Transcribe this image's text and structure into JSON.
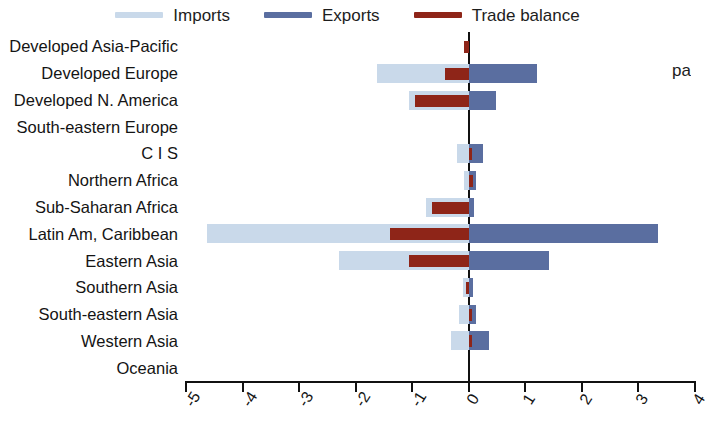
{
  "legend": {
    "entries": [
      {
        "label": "Imports",
        "color": "#c9d9ea",
        "key": "imports"
      },
      {
        "label": "Exports",
        "color": "#5a6ea0",
        "key": "exports"
      },
      {
        "label": "Trade balance",
        "color": "#8e2518",
        "key": "balance"
      }
    ]
  },
  "side_text": "pa",
  "chart_data": {
    "type": "bar",
    "orientation": "horizontal",
    "title": "",
    "subtitle": "",
    "xlabel": "",
    "ylabel": "",
    "xlim": [
      -5,
      4
    ],
    "xticks": [
      -5,
      -4,
      -3,
      -2,
      -1,
      0,
      1,
      2,
      3,
      4
    ],
    "xtick_labels": [
      "-5",
      "-4",
      "-3",
      "-2",
      "-1",
      "0",
      "1",
      "2",
      "3",
      "4"
    ],
    "grid": false,
    "legend_position": "top",
    "zero_line": 0,
    "categories": [
      "Developed Asia-Pacific",
      "Developed Europe",
      "Developed N. America",
      "South-eastern Europe",
      "C I S",
      "Northern Africa",
      "Sub-Saharan Africa",
      "Latin Am, Caribbean",
      "Eastern Asia",
      "Southern Asia",
      "South-eastern Asia",
      "Western Asia",
      "Oceania"
    ],
    "series": [
      {
        "name": "Imports",
        "color": "#c9d9ea",
        "values": [
          0.0,
          -1.63,
          -1.05,
          0.0,
          -0.2,
          -0.09,
          -0.75,
          -4.62,
          -2.3,
          -0.1,
          -0.18,
          -0.32,
          0.0
        ]
      },
      {
        "name": "Exports",
        "color": "#5a6ea0",
        "values": [
          0.0,
          1.2,
          0.48,
          0.0,
          0.26,
          0.13,
          0.1,
          3.35,
          1.41,
          0.07,
          0.13,
          0.36,
          0.0
        ]
      },
      {
        "name": "Trade balance",
        "color": "#8e2518",
        "values": [
          -0.09,
          -0.42,
          -0.95,
          0.0,
          0.06,
          0.07,
          -0.65,
          -1.4,
          -1.05,
          -0.05,
          0.05,
          0.06,
          0.0
        ]
      }
    ]
  }
}
